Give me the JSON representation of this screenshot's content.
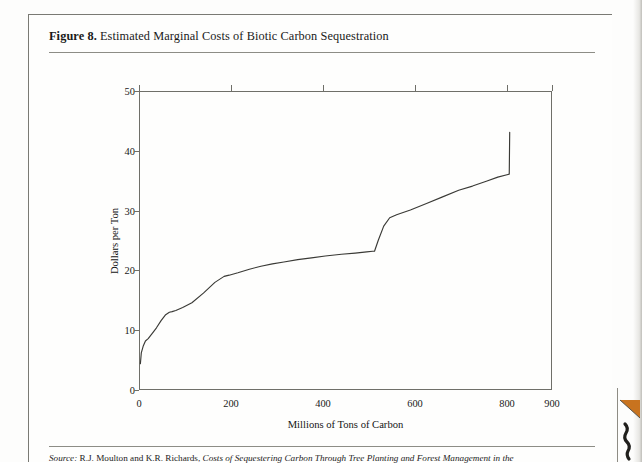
{
  "figure": {
    "label": "Figure 8.",
    "title": " Estimated Marginal Costs of Biotic Carbon Sequestration",
    "source_label": "Source:",
    "source_text": " R.J. Moulton and K.R. Richards, ",
    "source_italic": "Costs of Sequestering Carbon Through Tree Planting and Forest Management in the"
  },
  "colors": {
    "line": "#3a3a36",
    "axis": "#6f6f69",
    "text": "#1a1a1a",
    "rule": "#8d8d86",
    "curl": "#c8731f"
  },
  "chart_data": {
    "type": "line",
    "title": "Estimated Marginal Costs of Biotic Carbon Sequestration",
    "xlabel": "Millions of Tons of Carbon",
    "ylabel": "Dollars per Ton",
    "xlim": [
      0,
      900
    ],
    "ylim": [
      0,
      50
    ],
    "xticks": [
      0,
      200,
      400,
      600,
      800,
      900
    ],
    "xtick_labels": [
      "0",
      "200",
      "400",
      "600",
      "800",
      "900"
    ],
    "yticks": [
      0,
      10,
      20,
      30,
      40,
      50
    ],
    "ytick_labels": [
      "0",
      "10",
      "20",
      "30",
      "40",
      "50"
    ],
    "grid": false,
    "legend": false,
    "series": [
      {
        "name": "Marginal cost of biotic carbon sequestration",
        "x": [
          3,
          5,
          9,
          14,
          20,
          28,
          38,
          48,
          58,
          66,
          72,
          80,
          95,
          115,
          140,
          165,
          185,
          196,
          215,
          240,
          265,
          290,
          315,
          345,
          375,
          405,
          440,
          470,
          495,
          508,
          512,
          520,
          532,
          545,
          560,
          590,
          625,
          660,
          695,
          725,
          755,
          780,
          800,
          805,
          806
        ],
        "y": [
          4.4,
          6.2,
          7.3,
          8.2,
          8.6,
          9.4,
          10.4,
          11.6,
          12.6,
          13.0,
          13.1,
          13.3,
          13.8,
          14.6,
          16.2,
          18.0,
          19.0,
          19.2,
          19.6,
          20.2,
          20.7,
          21.1,
          21.4,
          21.8,
          22.1,
          22.4,
          22.7,
          22.9,
          23.1,
          23.2,
          23.2,
          25.0,
          27.4,
          28.8,
          29.3,
          30.1,
          31.2,
          32.3,
          33.4,
          34.1,
          34.9,
          35.6,
          36.0,
          36.1,
          43.1
        ]
      }
    ]
  }
}
